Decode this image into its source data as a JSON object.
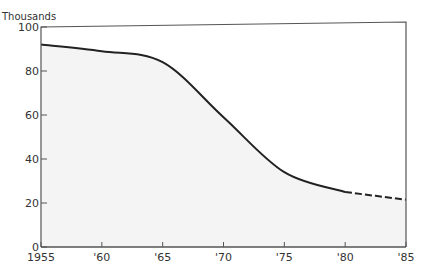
{
  "chart_data": {
    "type": "area",
    "title": "",
    "ylabel": "Thousands",
    "xlabel": "",
    "x": [
      1955,
      1960,
      1965,
      1970,
      1975,
      1980,
      1985
    ],
    "x_tick_labels": [
      "1955",
      "'60",
      "'65",
      "'70",
      "'75",
      "'80",
      "'85"
    ],
    "y_ticks": [
      0,
      20,
      40,
      60,
      80,
      100
    ],
    "y_tick_labels": [
      "0",
      "20",
      "40",
      "60",
      "80",
      "100"
    ],
    "xlim": [
      1955,
      1985
    ],
    "ylim": [
      0,
      100
    ],
    "grid": false,
    "legend": null,
    "series": [
      {
        "name": "Thousands",
        "values": [
          92,
          89,
          84,
          59,
          34,
          25,
          21.5
        ],
        "solid_until": 1980,
        "dashed_after": 1980
      }
    ],
    "colors": {
      "line": "#222222",
      "fill": "#f4f4f4",
      "axis": "#555555"
    }
  }
}
